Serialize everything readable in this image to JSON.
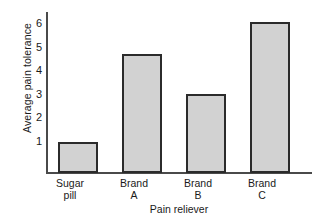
{
  "chart_data": {
    "type": "bar",
    "title": "",
    "xlabel": "Pain reliever",
    "ylabel": "Average pain tolerance",
    "categories": [
      "Sugar pill",
      "Brand A",
      "Brand B",
      "Brand C"
    ],
    "category_lines": [
      [
        "Sugar",
        "pill"
      ],
      [
        "Brand",
        "A"
      ],
      [
        "Brand",
        "B"
      ],
      [
        "Brand",
        "C"
      ]
    ],
    "values": [
      1.3,
      5.05,
      3.35,
      6.4
    ],
    "ylim": [
      0,
      6.8
    ],
    "yticks": [
      1,
      2,
      3,
      4,
      5,
      6
    ],
    "ytick_labels": [
      "1",
      "2",
      "3",
      "4",
      "5",
      "6"
    ],
    "grid": false,
    "legend": false,
    "bar_fill_color": "#d2d2d2",
    "bar_edge_color": "#2b2b2b",
    "axis_color": "#4a4a4a"
  }
}
